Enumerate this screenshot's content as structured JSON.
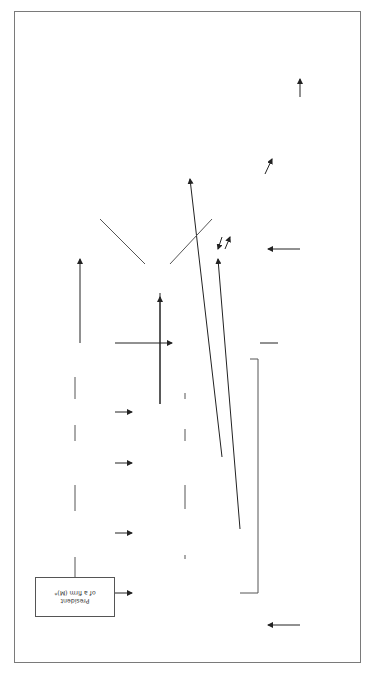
{
  "diagram": {
    "caption": "Figure 3. Overview of color function for clothes in NSF 3 (Unit 3): Dress (in business), Casual",
    "meaning_node": {
      "line1": "Meaning/",
      "line2": "Interpretation"
    },
    "categories": {
      "dress": "Dress (in business)",
      "casual": "Casual"
    },
    "characters": [
      {
        "lines": [
          "President",
          "of a firm (M)*"
        ]
      },
      {
        "lines": [
          "Three secretaries (F)",
          "",
          "Young inspector (F)"
        ]
      },
      {
        "lines": [
          "Commissary (M)",
          "",
          "Guide (M)"
        ]
      },
      {
        "lines": [
          "Doctor (M)"
        ]
      },
      {
        "lines": [
          "Shepherd (F)",
          "Guard of a casino (M)",
          "Novelist (F)",
          "Student (M)"
        ]
      }
    ],
    "clothes": [
      {
        "lines": [
          "• black suit",
          "• blue suit (Pantone 297 C, Heartland 151-4)",
          "• white shirt",
          "• light green tie (Pantone 317 C,",
          "Aqua whisper 256-3)"
        ]
      },
      {
        "lines": [
          "• black, light blue-violet (Blue Opal 347-3)",
          "• dark beige (Pantone 155 C, Lion's Mane 216-5)",
          "• blue skirt suit (Pantone 542 C, Blue Promise 249-4)",
          "• light green (Pantone 351 C, Green Balloon 204-4)",
          "• pink dresses (Pantone 189 C, Pink Flambe 234-4)",
          "• white shirt"
        ]
      },
      {
        "lines": [
          "• black suit",
          "• white shirt",
          "• black tie",
          "• beige (Pantone 466 C, Fresh Bread 321-4)",
          "• black hats"
        ]
      },
      {
        "lines": [
          "• white gown"
        ]
      },
      {
        "lines": [
          "• beige (Taupe Tone 426-4)",
          "• light green skirts (Pantone 317 C, Aqua Whisper 256-3)",
          "• light violet slacks (Fresh Lavender 345-5)",
          "• light blue jacket (Pantone 297 C, Arabella 351-4)",
          "• black dress",
          "• light violet pajama (Easter Egg 347-4)"
        ]
      }
    ],
    "casual_box": {
      "lines": [
        "• beige slacks (Bon Bon 426-3)",
        "• light green pullover (Pantone 317 C,",
        "Pine Whisper 505-4)"
      ]
    },
    "interpretations": {
      "business_codes": [
        "Conventional",
        "business suit codes:",
        "seriousness",
        "steadiness",
        "formality",
        "self-restraint",
        "but",
        "rather faded colors",
        "are used",
        "compared with",
        "those in NSF 2",
        "(Unit 2)"
      ],
      "non_realistic": [
        "Rather non-realistic",
        "color codes for",
        "business suits"
      ],
      "conventional_white": [
        "Conventional color code:",
        "honesty, fidelity"
      ],
      "possible_colors": [
        "Possible colors but",
        "difficult to find",
        "any specific",
        "cultural meanings"
      ]
    }
  }
}
